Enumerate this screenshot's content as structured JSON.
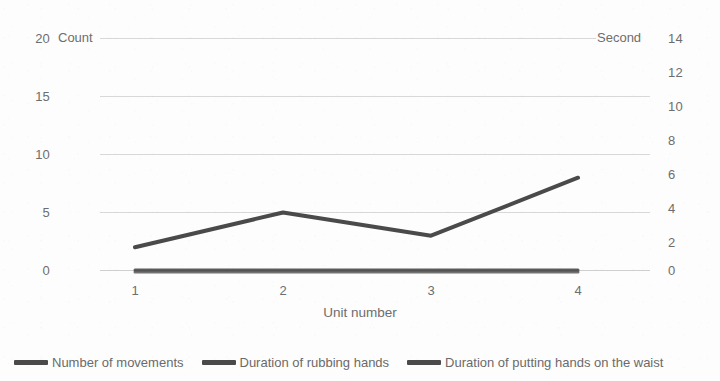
{
  "chart_data": {
    "type": "line",
    "title": "",
    "xlabel": "Unit number",
    "categories": [
      "1",
      "2",
      "3",
      "4"
    ],
    "x": [
      1,
      2,
      3,
      4
    ],
    "grid": true,
    "legend_position": "bottom",
    "series": [
      {
        "name": "Number of movements",
        "axis": "left",
        "unit": "Count",
        "color": "#4a4a4a",
        "values": [
          2,
          5,
          3,
          8
        ]
      },
      {
        "name": "Duration of rubbing hands",
        "axis": "right",
        "unit": "Second",
        "color": "#4a4a4a",
        "values": [
          0,
          0,
          0,
          0
        ]
      },
      {
        "name": "Duration of putting hands on the waist",
        "axis": "right",
        "unit": "Second",
        "color": "#4a4a4a",
        "values": [
          0,
          0,
          0,
          0
        ]
      }
    ],
    "left_axis": {
      "unit_label": "Count",
      "ticks": [
        "20",
        "15",
        "10",
        "5",
        "0"
      ],
      "ylim": [
        0,
        20
      ]
    },
    "right_axis": {
      "unit_label": "Second",
      "ticks": [
        "14",
        "12",
        "10",
        "8",
        "6",
        "4",
        "2",
        "0"
      ],
      "ylim": [
        0,
        14
      ]
    }
  },
  "left_axis_ticks": [
    {
      "label": "20",
      "y": 31
    },
    {
      "label": "15",
      "y": 89
    },
    {
      "label": "10",
      "y": 147
    },
    {
      "label": "5",
      "y": 205
    },
    {
      "label": "0",
      "y": 263
    }
  ],
  "right_axis_ticks": [
    {
      "label": "14",
      "y": 31
    },
    {
      "label": "12",
      "y": 65
    },
    {
      "label": "10",
      "y": 99
    },
    {
      "label": "8",
      "y": 133
    },
    {
      "label": "6",
      "y": 167
    },
    {
      "label": "4",
      "y": 201
    },
    {
      "label": "2",
      "y": 235
    },
    {
      "label": "0",
      "y": 263
    }
  ],
  "unit_labels": {
    "left": "Count",
    "right": "Second"
  },
  "x_ticks": [
    {
      "label": "1",
      "x": 135
    },
    {
      "label": "2",
      "x": 283
    },
    {
      "label": "3",
      "x": 431
    },
    {
      "label": "4",
      "x": 578
    }
  ],
  "x_axis_title": "Unit number",
  "legend": [
    {
      "label": "Number of movements",
      "color": "#4a4a4a"
    },
    {
      "label": "Duration of rubbing hands",
      "color": "#4a4a4a"
    },
    {
      "label": "Duration of putting hands on the waist",
      "color": "#4a4a4a"
    }
  ],
  "colors": {
    "line": "#4a4a4a",
    "grid": "#d5d5d5",
    "text": "#6d6d6d",
    "background": "#ffffff"
  }
}
